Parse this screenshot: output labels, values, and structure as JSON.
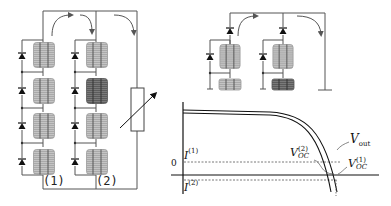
{
  "diagram": {
    "title": "",
    "left_circuit": {
      "strings": [
        {
          "label": "(1)",
          "cells": 4,
          "shaded_cell_index": null
        },
        {
          "label": "(2)",
          "cells": 4,
          "shaded_cell_index": 1
        }
      ],
      "bypass_diodes_per_string": 4,
      "load": "variable-resistor"
    },
    "top_right_circuit": {
      "strings": 2,
      "blocking_diodes": 2,
      "shaded_cell_string": 2
    },
    "iv_plot": {
      "zero_label": "0",
      "current_labels": [
        {
          "base": "I",
          "sup": "(1)"
        },
        {
          "base": "I",
          "sup": "(2)"
        }
      ],
      "voltage_labels": [
        {
          "base": "V",
          "sub": "OC",
          "sup": "(2)"
        },
        {
          "base": "V",
          "sub": "out"
        },
        {
          "base": "V",
          "sub": "OC",
          "sup": "(1)"
        }
      ]
    },
    "colors": {
      "line": "#444444",
      "cell_light": "#b5b5b5",
      "cell_dark": "#6a6a6a",
      "curve": "#111111",
      "dashed": "#555555"
    }
  }
}
